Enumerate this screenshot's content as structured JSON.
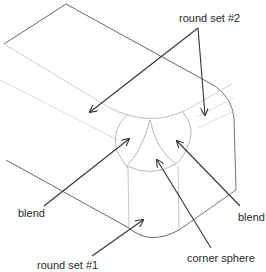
{
  "diagram": {
    "type": "isometric-solid-with-rounded-corner",
    "labels": {
      "round_set_2": "round set #2",
      "blend_left": "blend",
      "blend_right": "blend",
      "corner_sphere": "corner sphere",
      "round_set_1": "round set #1"
    },
    "colors": {
      "edge_dark": "#555555",
      "edge_light": "#bfbfbf",
      "arrow": "#333333",
      "background": "#ffffff"
    }
  }
}
